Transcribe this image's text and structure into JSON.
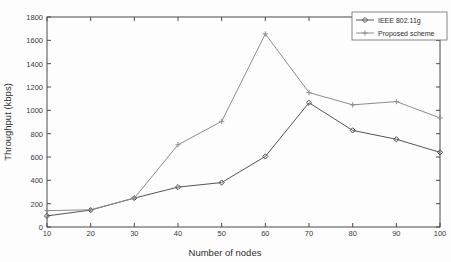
{
  "chart_data": {
    "type": "line",
    "title": "",
    "xlabel": "Number of nodes",
    "ylabel": "Throughput (kbps)",
    "xlim": [
      10,
      100
    ],
    "ylim": [
      0,
      1800
    ],
    "xticks": [
      10,
      20,
      30,
      40,
      50,
      60,
      70,
      80,
      90,
      100
    ],
    "yticks": [
      0,
      200,
      400,
      600,
      800,
      1000,
      1200,
      1400,
      1600,
      1800
    ],
    "xtick_labels": [
      "10",
      "20",
      "30",
      "40",
      "50",
      "60",
      "70",
      "80",
      "90",
      "100"
    ],
    "ytick_labels": [
      "0",
      "200",
      "400",
      "600",
      "800",
      "1000",
      "1200",
      "1400",
      "1600",
      "1800"
    ],
    "grid": false,
    "legend_position": "top-right",
    "x": [
      10,
      20,
      30,
      40,
      50,
      60,
      70,
      80,
      90,
      100
    ],
    "series": [
      {
        "name": "IEEE 802.11g",
        "marker": "diamond",
        "color": "#4b4b4b",
        "values": [
          95,
          145,
          248,
          342,
          381,
          605,
          1065,
          828,
          752,
          640
        ]
      },
      {
        "name": "Proposed scheme",
        "marker": "plus",
        "color": "#8d8d8d",
        "values": [
          140,
          148,
          248,
          705,
          905,
          1655,
          1152,
          1047,
          1075,
          935
        ]
      }
    ]
  },
  "legend": {
    "entries": [
      {
        "label": "IEEE 802.11g"
      },
      {
        "label": "Proposed scheme"
      }
    ]
  },
  "axes": {
    "x_title": "Number of nodes",
    "y_title": "Throughput (kbps)"
  }
}
